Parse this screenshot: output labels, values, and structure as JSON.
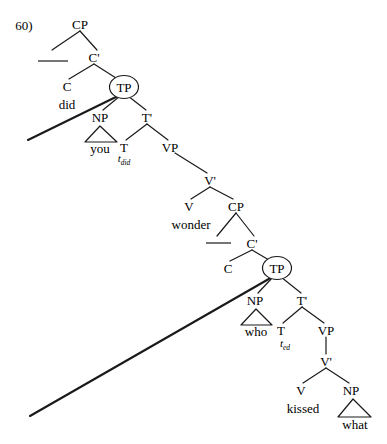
{
  "figure": {
    "example_number": "60)",
    "type": "syntactic-tree-diagram",
    "sentence": "did you wonder who kissed what",
    "ink_color": "#1a1a1a",
    "background_color": "#ffffff"
  },
  "nodes": [
    {
      "id": "cp1",
      "label": "CP",
      "x": 80,
      "y": 24,
      "circled": false
    },
    {
      "id": "cbar1",
      "label": "C'",
      "x": 94,
      "y": 57,
      "circled": false
    },
    {
      "id": "c1",
      "label": "C",
      "x": 67,
      "y": 86,
      "circled": false
    },
    {
      "id": "tp1",
      "label": "TP",
      "x": 124,
      "y": 87,
      "circled": true
    },
    {
      "id": "np1",
      "label": "NP",
      "x": 100,
      "y": 117,
      "circled": false
    },
    {
      "id": "tbar1",
      "label": "T'",
      "x": 147,
      "y": 117,
      "circled": false
    },
    {
      "id": "t1",
      "label": "T",
      "x": 124,
      "y": 147,
      "circled": false
    },
    {
      "id": "vp1",
      "label": "VP",
      "x": 170,
      "y": 147,
      "circled": false
    },
    {
      "id": "vbar1",
      "label": "V'",
      "x": 210,
      "y": 180,
      "circled": false
    },
    {
      "id": "v1",
      "label": "V",
      "x": 189,
      "y": 206,
      "circled": false
    },
    {
      "id": "cp2",
      "label": "CP",
      "x": 236,
      "y": 206,
      "circled": false
    },
    {
      "id": "cbar2",
      "label": "C'",
      "x": 252,
      "y": 243,
      "circled": false
    },
    {
      "id": "c2",
      "label": "C",
      "x": 228,
      "y": 268,
      "circled": false
    },
    {
      "id": "tp2",
      "label": "TP",
      "x": 277,
      "y": 268,
      "circled": true
    },
    {
      "id": "np2",
      "label": "NP",
      "x": 255,
      "y": 300,
      "circled": false
    },
    {
      "id": "tbar2",
      "label": "T'",
      "x": 302,
      "y": 300,
      "circled": false
    },
    {
      "id": "t2",
      "label": "T",
      "x": 281,
      "y": 330,
      "circled": false
    },
    {
      "id": "vp2",
      "label": "VP",
      "x": 326,
      "y": 330,
      "circled": false
    },
    {
      "id": "vbar2",
      "label": "V'",
      "x": 326,
      "y": 361,
      "circled": false
    },
    {
      "id": "v2",
      "label": "V",
      "x": 301,
      "y": 390,
      "circled": false
    },
    {
      "id": "np3",
      "label": "NP",
      "x": 351,
      "y": 390,
      "circled": false
    }
  ],
  "words": [
    {
      "id": "did",
      "label": "did",
      "x": 67,
      "y": 104
    },
    {
      "id": "you",
      "label": "you",
      "x": 100,
      "y": 148
    },
    {
      "id": "wonder",
      "label": "wonder",
      "x": 191,
      "y": 224
    },
    {
      "id": "who",
      "label": "who",
      "x": 256,
      "y": 331
    },
    {
      "id": "kissed",
      "label": "kissed",
      "x": 303,
      "y": 408
    },
    {
      "id": "what",
      "label": "what",
      "x": 355,
      "y": 424
    }
  ],
  "traces": [
    {
      "id": "t-did",
      "base": "t",
      "subscript": "did",
      "x": 124,
      "y": 160
    },
    {
      "id": "t-ed",
      "base": "t",
      "subscript": "ed",
      "x": 285,
      "y": 345
    }
  ],
  "triangles": [
    {
      "id": "tri-you",
      "apex_x": 100,
      "apex_y": 126,
      "left_x": 85,
      "right_x": 117,
      "base_y": 142
    },
    {
      "id": "tri-who",
      "apex_x": 256,
      "apex_y": 309,
      "left_x": 241,
      "right_x": 272,
      "base_y": 325
    },
    {
      "id": "tri-what",
      "apex_x": 353,
      "apex_y": 399,
      "left_x": 338,
      "right_x": 371,
      "base_y": 417
    }
  ],
  "branches": [
    {
      "from": "cp1",
      "to": "blank1",
      "x1": 80,
      "y1": 31,
      "x2": 52,
      "y2": 50
    },
    {
      "from": "cp1",
      "to": "cbar1",
      "x1": 80,
      "y1": 31,
      "x2": 97,
      "y2": 50
    },
    {
      "from": "cbar1",
      "to": "c1",
      "x1": 94,
      "y1": 64,
      "x2": 69,
      "y2": 79
    },
    {
      "from": "cbar1",
      "to": "tp1",
      "x1": 94,
      "y1": 64,
      "x2": 116,
      "y2": 78
    },
    {
      "from": "tp1",
      "to": "np1",
      "x1": 120,
      "y1": 96,
      "x2": 103,
      "y2": 110
    },
    {
      "from": "tp1",
      "to": "tbar1",
      "x1": 128,
      "y1": 96,
      "x2": 146,
      "y2": 110
    },
    {
      "from": "tbar1",
      "to": "t1",
      "x1": 147,
      "y1": 124,
      "x2": 126,
      "y2": 140
    },
    {
      "from": "tbar1",
      "to": "vp1",
      "x1": 147,
      "y1": 124,
      "x2": 168,
      "y2": 140
    },
    {
      "from": "vp1",
      "to": "vbar1",
      "x1": 175,
      "y1": 153,
      "x2": 207,
      "y2": 173
    },
    {
      "from": "vbar1",
      "to": "v1",
      "x1": 210,
      "y1": 187,
      "x2": 191,
      "y2": 199
    },
    {
      "from": "vbar1",
      "to": "cp2",
      "x1": 210,
      "y1": 187,
      "x2": 233,
      "y2": 199
    },
    {
      "from": "cp2",
      "to": "blank2",
      "x1": 236,
      "y1": 213,
      "x2": 217,
      "y2": 236
    },
    {
      "from": "cp2",
      "to": "cbar2",
      "x1": 236,
      "y1": 213,
      "x2": 254,
      "y2": 236
    },
    {
      "from": "cbar2",
      "to": "c2",
      "x1": 252,
      "y1": 250,
      "x2": 230,
      "y2": 261
    },
    {
      "from": "cbar2",
      "to": "tp2",
      "x1": 252,
      "y1": 250,
      "x2": 269,
      "y2": 260
    },
    {
      "from": "tp2",
      "to": "np2",
      "x1": 273,
      "y1": 277,
      "x2": 258,
      "y2": 293
    },
    {
      "from": "tp2",
      "to": "tbar2",
      "x1": 281,
      "y1": 277,
      "x2": 301,
      "y2": 293
    },
    {
      "from": "tbar2",
      "to": "t2",
      "x1": 302,
      "y1": 307,
      "x2": 283,
      "y2": 323
    },
    {
      "from": "tbar2",
      "to": "vp2",
      "x1": 302,
      "y1": 307,
      "x2": 324,
      "y2": 323
    },
    {
      "from": "vp2",
      "to": "vbar2",
      "x1": 326,
      "y1": 337,
      "x2": 326,
      "y2": 354
    },
    {
      "from": "vbar2",
      "to": "v2",
      "x1": 326,
      "y1": 368,
      "x2": 303,
      "y2": 383
    },
    {
      "from": "vbar2",
      "to": "np3",
      "x1": 326,
      "y1": 368,
      "x2": 349,
      "y2": 383
    }
  ],
  "movement_lines": [
    {
      "id": "move-did",
      "x1": 28,
      "y1": 140,
      "x2": 122,
      "y2": 94,
      "description": "did moves from T to C"
    },
    {
      "id": "move-what",
      "x1": 30,
      "y1": 416,
      "x2": 274,
      "y2": 276,
      "description": "wh-phrase moves to spec-CP"
    }
  ],
  "blanks": [
    {
      "id": "blank-spec-cp1",
      "x1": 38,
      "y1": 61,
      "x2": 68,
      "y2": 61
    },
    {
      "id": "blank-spec-cp2",
      "x1": 206,
      "y1": 243,
      "x2": 231,
      "y2": 243
    }
  ]
}
